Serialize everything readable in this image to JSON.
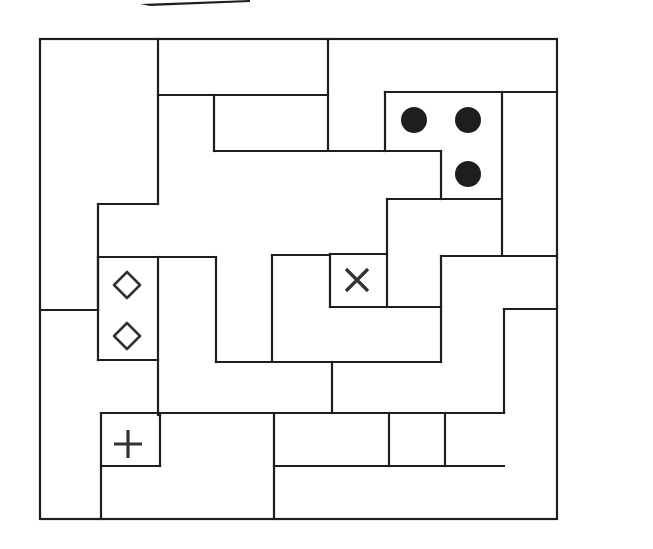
{
  "diagram": {
    "type": "region-division-puzzle",
    "width": 653,
    "height": 549,
    "colors": {
      "line": "#1e1e1e",
      "background": "#ffffff",
      "symbol": "#333333"
    },
    "corner_mark": {
      "points": "140,4 250,0 250,2 150,6"
    },
    "outer_border": {
      "x": 40,
      "y": 39,
      "w": 517,
      "h": 480
    },
    "walls": [
      "158,39 158,204",
      "158,204 98,204",
      "98,204 98,310",
      "40,310 98,310",
      "158,95 328,95",
      "328,39 328,151",
      "214,95 214,151",
      "214,151 441,151",
      "385,151 385,92",
      "385,92 557,92",
      "502,92 502,254",
      "441,151 441,199",
      "441,199 502,199",
      "387,199 441,199",
      "387,199 387,307",
      "387,254 330,254",
      "330,254 330,307",
      "330,307 441,307",
      "441,307 441,256",
      "441,256 557,256",
      "272,255 330,255",
      "272,255 272,361",
      "98,257 216,257",
      "98,257 98,360",
      "98,360 158,360",
      "158,257 158,415",
      "216,257 216,362",
      "216,362 441,362",
      "441,362 441,307",
      "332,362 332,413",
      "101,413 504,413",
      "101,413 101,519",
      "101,466 160,466",
      "160,413 160,466",
      "274,413 274,519",
      "274,466 504,466",
      "389,413 389,466",
      "445,413 445,466",
      "504,413 504,309",
      "504,309 557,309"
    ],
    "symbols": [
      {
        "kind": "dot",
        "name": "filled-dot-1",
        "x": 414,
        "y": 120,
        "r": 13
      },
      {
        "kind": "dot",
        "name": "filled-dot-2",
        "x": 468,
        "y": 120,
        "r": 13
      },
      {
        "kind": "dot",
        "name": "filled-dot-3",
        "x": 468,
        "y": 174,
        "r": 13
      },
      {
        "kind": "diamond",
        "name": "diamond-1",
        "x": 127,
        "y": 285,
        "s": 13
      },
      {
        "kind": "diamond",
        "name": "diamond-2",
        "x": 127,
        "y": 336,
        "s": 13
      },
      {
        "kind": "cross-x",
        "name": "x-mark",
        "x": 357,
        "y": 280,
        "s": 11
      },
      {
        "kind": "plus",
        "name": "plus-mark",
        "x": 128,
        "y": 444,
        "s": 14
      }
    ]
  }
}
